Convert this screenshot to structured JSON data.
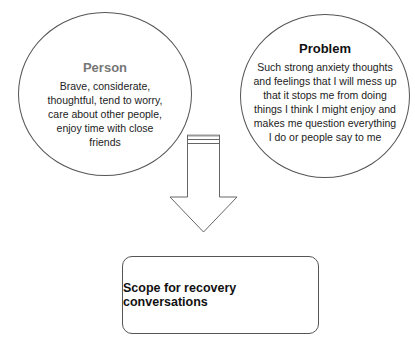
{
  "person": {
    "title": "Person",
    "body": "Brave, considerate, thoughtful, tend to worry, care about other people, enjoy time with close friends"
  },
  "problem": {
    "title": "Problem",
    "body": "Such strong anxiety thoughts and feelings that I will mess up that it stops me from doing things I think I might enjoy and makes me question everything I do or people say to me"
  },
  "outcome": {
    "label": "Scope for recovery conversations"
  },
  "colors": {
    "person_title": "#777777",
    "stroke": "#555555"
  }
}
